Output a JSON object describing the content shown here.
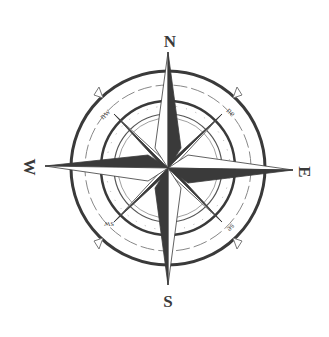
{
  "compass": {
    "cardinals": {
      "north": "N",
      "east": "E",
      "south": "S",
      "west": "W"
    },
    "intercardinals": {
      "northeast": "ne",
      "southeast": "se",
      "southwest": "sw",
      "northwest": "nw"
    },
    "colors": {
      "ink": "#3a3a3a",
      "fill_light": "#ffffff",
      "ring_thin": "#777777"
    }
  }
}
